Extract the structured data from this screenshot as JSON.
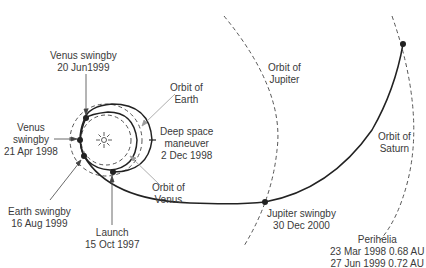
{
  "diagram": {
    "labels": {
      "venus_swingby_2": {
        "line1": "Venus swingby",
        "line2": "20 Jun1999"
      },
      "orbit_earth": {
        "line1": "Orbit of",
        "line2": "Earth"
      },
      "venus_swingby_1": {
        "line1": "Venus",
        "line2": "swingby",
        "line3": "21 Apr 1998"
      },
      "deep_space": {
        "line1": "Deep space",
        "line2": "maneuver",
        "line3": "2 Dec 1998"
      },
      "orbit_venus": {
        "line1": "Orbit of",
        "line2": "Venus"
      },
      "earth_swingby": {
        "line1": "Earth swingby",
        "line2": "16 Aug 1999"
      },
      "launch": {
        "line1": "Launch",
        "line2": "15 Oct 1997"
      },
      "orbit_jupiter": {
        "line1": "Orbit of",
        "line2": "Jupiter"
      },
      "jupiter_swingby": {
        "line1": "Jupiter swingby",
        "line2": "30 Dec 2000"
      },
      "orbit_saturn": {
        "line1": "Orbit of",
        "line2": "Saturn"
      },
      "perihelia": {
        "line1": "Perihelia",
        "line2": "23 Mar 1998 0.68 AU",
        "line3": "27 Jun 1999 0.72 AU"
      }
    },
    "icons": {
      "sun": "sun-icon"
    },
    "colors": {
      "line": "#222222",
      "dashed": "#555555",
      "text": "#3a3a3a"
    }
  }
}
